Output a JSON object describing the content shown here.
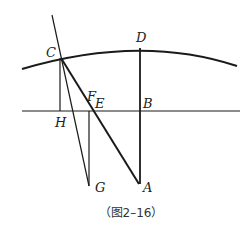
{
  "figure": {
    "caption": "（图2–16）",
    "labels": {
      "A": "A",
      "B": "B",
      "C": "C",
      "D": "D",
      "E": "E",
      "F": "F",
      "G": "G",
      "H": "H"
    },
    "points": {
      "A": [
        139,
        184
      ],
      "B": [
        140,
        111
      ],
      "C": [
        61,
        58
      ],
      "D": [
        140,
        48
      ],
      "E": [
        92,
        111
      ],
      "F": [
        90,
        111
      ],
      "G": [
        89,
        186
      ],
      "H": [
        60,
        111
      ]
    },
    "segments": [
      {
        "name": "arc-earth-surface",
        "type": "arc",
        "through": [
          "C",
          "D"
        ]
      },
      {
        "name": "horizontal-line",
        "from": [
          22,
          111
        ],
        "to": [
          240,
          111
        ]
      },
      {
        "name": "vertical-DA",
        "from": "D",
        "to": "A"
      },
      {
        "name": "line-CA",
        "from": "C",
        "to": "A"
      },
      {
        "name": "vertical-CH",
        "from": "C",
        "to": "H"
      },
      {
        "name": "vertical-FG",
        "from": "F",
        "to": "G"
      },
      {
        "name": "line-through-C-to-G",
        "from": [
          52,
          15
        ],
        "to": "G"
      }
    ],
    "colors": {
      "line": "#1a1a1a",
      "label": "#222222",
      "caption": "#333333"
    }
  }
}
